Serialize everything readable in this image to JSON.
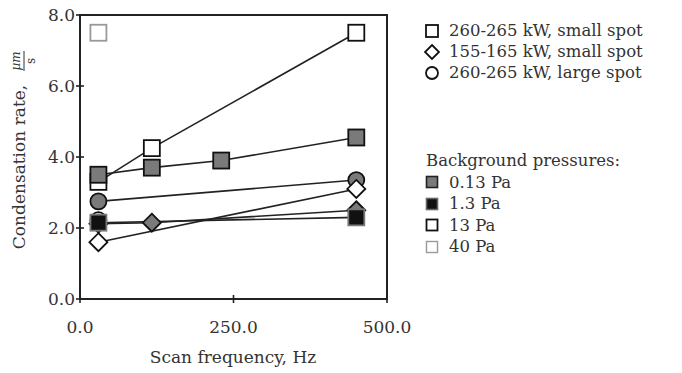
{
  "chart_data": {
    "type": "scatter",
    "title": "",
    "xlabel": "Scan frequency, Hz",
    "ylabel": "Condensation rate, µm/s",
    "ylabel_main": "Condensation rate,",
    "ylabel_unit_num": "µm",
    "ylabel_unit_den": "s",
    "xlim": [
      0,
      500
    ],
    "ylim": [
      0,
      8
    ],
    "x_ticks": [
      0,
      250,
      500
    ],
    "x_tick_labels": [
      "0.0",
      "250.0",
      "500.0"
    ],
    "y_ticks": [
      0,
      2,
      4,
      6,
      8
    ],
    "y_tick_labels": [
      "0.0",
      "2.0",
      "4.0",
      "6.0",
      "8.0"
    ],
    "grid": false,
    "legend_position": "right, outside plot",
    "series": [
      {
        "name": "260-265 kW, small spot, 13 Pa",
        "marker": "square",
        "fill": "#ffffff",
        "stroke": "#111111",
        "connected": true,
        "x": [
          30,
          117,
          450
        ],
        "y": [
          3.3,
          4.25,
          7.5
        ]
      },
      {
        "name": "260-265 kW, small spot, 0.13 Pa",
        "marker": "square",
        "fill": "#7a7a7a",
        "stroke": "#111111",
        "connected": true,
        "x": [
          30,
          117,
          230,
          450
        ],
        "y": [
          3.5,
          3.7,
          3.9,
          4.55
        ]
      },
      {
        "name": "260-265 kW, large spot, 0.13 Pa",
        "marker": "circle",
        "fill": "#7a7a7a",
        "stroke": "#111111",
        "connected": true,
        "x": [
          30,
          450
        ],
        "y": [
          2.75,
          3.35
        ]
      },
      {
        "name": "260-265 kW, large spot, 13 Pa",
        "marker": "circle",
        "fill": "#ffffff",
        "stroke": "#111111",
        "connected": false,
        "x": [
          30
        ],
        "y": [
          2.22
        ]
      },
      {
        "name": "155-165 kW, small spot, 0.13 Pa",
        "marker": "diamond",
        "fill": "#7a7a7a",
        "stroke": "#111111",
        "connected": true,
        "x": [
          30,
          117,
          450
        ],
        "y": [
          2.12,
          2.15,
          2.5
        ]
      },
      {
        "name": "155-165 kW, small spot, 1.3 Pa",
        "marker": "square",
        "fill": "#111111",
        "stroke": "#777777",
        "connected": true,
        "x": [
          30,
          450
        ],
        "y": [
          2.15,
          2.3
        ]
      },
      {
        "name": "155-165 kW, small spot, 13 Pa",
        "marker": "diamond",
        "fill": "#ffffff",
        "stroke": "#111111",
        "connected": true,
        "x": [
          30,
          450
        ],
        "y": [
          1.6,
          3.1
        ]
      },
      {
        "name": "260-265 kW, small spot, 40 Pa",
        "marker": "square",
        "fill": "#ffffff",
        "stroke": "#999999",
        "connected": false,
        "x": [
          30
        ],
        "y": [
          7.5
        ]
      }
    ],
    "legend_shapes": [
      {
        "shape": "square",
        "label": "260-265 kW, small spot"
      },
      {
        "shape": "diamond",
        "label": "155-165 kW, small spot"
      },
      {
        "shape": "circle",
        "label": "260-265 kW, large spot"
      }
    ],
    "legend_pressures_title": "Background pressures:",
    "legend_pressures": [
      {
        "fill": "#7a7a7a",
        "stroke": "#222222",
        "label": "0.13 Pa"
      },
      {
        "fill": "#111111",
        "stroke": "#666666",
        "label": "1.3 Pa"
      },
      {
        "fill": "#ffffff",
        "stroke": "#111111",
        "label": "13 Pa"
      },
      {
        "fill": "#ffffff",
        "stroke": "#999999",
        "label": "40 Pa"
      }
    ]
  }
}
